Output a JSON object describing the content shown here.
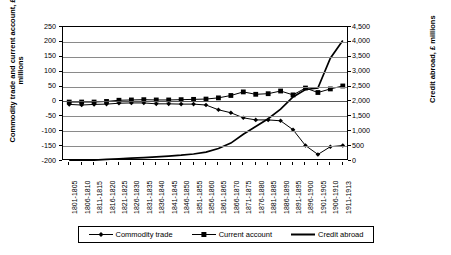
{
  "axis_titles": {
    "left": "Commodity trade and current account, £ millions",
    "right": "Credit abroad, £ millions"
  },
  "legend": {
    "items": [
      {
        "label": "Commodity trade",
        "marker": "diamond"
      },
      {
        "label": "Current account",
        "marker": "square"
      },
      {
        "label": "Credit abroad",
        "marker": "line"
      }
    ]
  },
  "left_axis": {
    "ticks": [
      "250",
      "200",
      "150",
      "100",
      "50",
      "0",
      "-50",
      "-100",
      "-150",
      "-200"
    ],
    "min": -200,
    "max": 250,
    "step": 50
  },
  "right_axis": {
    "ticks": [
      "4,500",
      "4,000",
      "3,500",
      "3,000",
      "2,500",
      "2,000",
      "1,500",
      "1,000",
      "500",
      "0"
    ],
    "min": 0,
    "max": 4500,
    "step": 500
  },
  "chart_data": {
    "type": "line",
    "title": "",
    "xlabel": "",
    "ylabel": "Commodity trade and current account, £ millions",
    "y2label": "Credit abroad, £ millions",
    "grid": true,
    "legend_position": "bottom",
    "ylim": [
      -200,
      250
    ],
    "y2lim": [
      0,
      4500
    ],
    "categories": [
      "1801-1805",
      "1806-1810",
      "1811-1815",
      "1816-1820",
      "1821-1825",
      "1826-1830",
      "1831-1835",
      "1836-1840",
      "1841-1845",
      "1846-1850",
      "1851-1855",
      "1856-1860",
      "1861-1865",
      "1866-1870",
      "1871-1875",
      "1876-1880",
      "1881-1885",
      "1886-1890",
      "1891-1895",
      "1896-1900",
      "1901-1905",
      "1906-1910",
      "1911-1913"
    ],
    "series": [
      {
        "name": "Commodity trade",
        "axis": "left",
        "marker": "diamond",
        "values": [
          -10,
          -12,
          -10,
          -9,
          -6,
          -5,
          -5,
          -8,
          -8,
          -9,
          -9,
          -12,
          -28,
          -38,
          -55,
          -62,
          -62,
          -65,
          -95,
          -148,
          -178,
          -152,
          -148
        ]
      },
      {
        "name": "Current account",
        "axis": "left",
        "marker": "square",
        "values": [
          -2,
          -2,
          -2,
          0,
          4,
          5,
          6,
          5,
          5,
          6,
          7,
          8,
          12,
          20,
          32,
          24,
          26,
          35,
          22,
          45,
          30,
          42,
          52
        ]
      },
      {
        "name": "Credit abroad",
        "axis": "right",
        "marker": "none",
        "values": [
          30,
          30,
          30,
          55,
          75,
          95,
          115,
          140,
          165,
          195,
          235,
          300,
          420,
          600,
          900,
          1160,
          1420,
          1740,
          2150,
          2400,
          2450,
          3450,
          4050
        ]
      }
    ]
  }
}
